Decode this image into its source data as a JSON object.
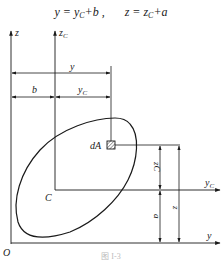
{
  "formula": {
    "part1_lhs": "y",
    "part1_rhs_var": "y",
    "part1_rhs_sub": "C",
    "part1_rhs_tail": "+b ,",
    "part2_lhs": "z",
    "part2_rhs_var": "z",
    "part2_rhs_sub": "C",
    "part2_rhs_tail": "+a"
  },
  "axes": {
    "z": "z",
    "zC_main": "z",
    "zC_sub": "C",
    "y": "y",
    "yC_main": "y",
    "yC_sub": "C",
    "origin": "O"
  },
  "dimensions": {
    "y": "y",
    "b": "b",
    "yC_main": "y",
    "yC_sub": "C",
    "zC": "zC",
    "a": "a",
    "z": "z"
  },
  "points": {
    "centroid": "C",
    "element": "dA"
  },
  "caption": "图 I-3",
  "colors": {
    "line": "#1a1a1a",
    "background": "#ffffff"
  }
}
